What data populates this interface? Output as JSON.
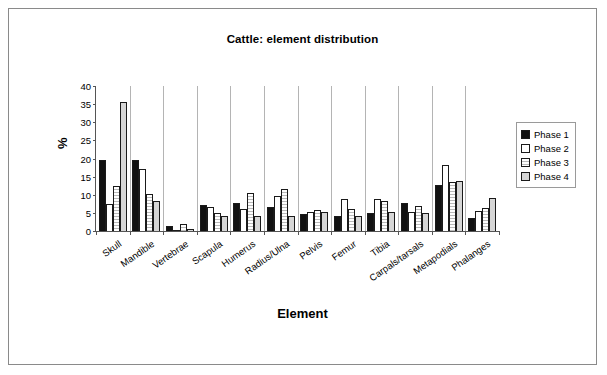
{
  "figure": {
    "border_color": "#8a8a8a"
  },
  "chart_data": {
    "type": "bar",
    "title": "Cattle: element distribution",
    "xlabel": "Element",
    "ylabel": "%",
    "ylim": [
      0,
      40
    ],
    "ytick_step": 5,
    "yticks": [
      0,
      5,
      10,
      15,
      20,
      25,
      30,
      35,
      40
    ],
    "grid": "category-separators",
    "legend_position": "right",
    "categories": [
      "Skull",
      "Mandible",
      "Vertebrae",
      "Scapula",
      "Humerus",
      "Radius/Ulna",
      "Pelvis",
      "Femur",
      "Tibia",
      "Carpals/tarsals",
      "Metapodials",
      "Phalanges"
    ],
    "series": [
      {
        "name": "Phase 1",
        "color": "#111111",
        "values": [
          19.5,
          19.5,
          1.3,
          7.3,
          7.8,
          6.6,
          4.7,
          4.2,
          5.1,
          7.8,
          12.8,
          3.7
        ]
      },
      {
        "name": "Phase 2",
        "color": "#ffffff",
        "values": [
          7.5,
          17.1,
          0.4,
          6.7,
          6.0,
          9.6,
          5.3,
          8.7,
          8.7,
          5.3,
          18.3,
          5.5
        ]
      },
      {
        "name": "Phase 3",
        "color": "#ffffff",
        "values": [
          12.3,
          10.3,
          1.9,
          5.0,
          10.5,
          11.6,
          5.7,
          6.2,
          8.4,
          6.9,
          13.4,
          6.3
        ]
      },
      {
        "name": "Phase 4",
        "color": "#d6d6d6",
        "values": [
          35.5,
          8.3,
          0.5,
          4.1,
          4.2,
          4.1,
          5.3,
          4.2,
          5.3,
          4.9,
          13.7,
          9.1
        ]
      }
    ]
  }
}
